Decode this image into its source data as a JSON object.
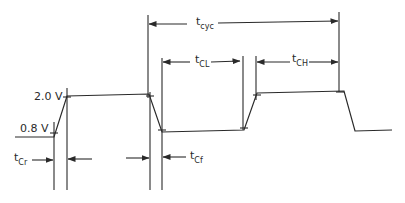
{
  "diagram": {
    "type": "clock timing diagram",
    "voltage_levels": {
      "high": "2.0 V",
      "low": "0.8 V"
    },
    "timing_labels": {
      "cycle": {
        "main": "t",
        "sub": "cyc"
      },
      "clock_low": {
        "main": "t",
        "sub": "CL"
      },
      "clock_high": {
        "main": "t",
        "sub": "CH"
      },
      "clock_rise": {
        "main": "t",
        "sub": "Cr"
      },
      "clock_fall": {
        "main": "t",
        "sub": "Cf"
      }
    },
    "colors": {
      "line": "#2a2a2a",
      "background": "#ffffff"
    }
  }
}
